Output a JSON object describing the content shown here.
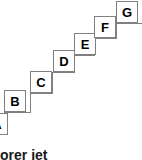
{
  "figure": {
    "type": "staircase-diagram",
    "colors": {
      "background": "#ffffff",
      "node_fill": "#ffffff",
      "node_border": "#808080",
      "step_line": "#808080",
      "label_text": "#000000",
      "caption_text": "#1a1a1a"
    },
    "nodes": [
      {
        "label": "A",
        "x": -14,
        "y": 113,
        "size": 22,
        "clipped": true
      },
      {
        "label": "B",
        "x": 4,
        "y": 90,
        "size": 22,
        "clipped": false
      },
      {
        "label": "C",
        "x": 30,
        "y": 71,
        "size": 22,
        "clipped": false
      },
      {
        "label": "D",
        "x": 53,
        "y": 50,
        "size": 22,
        "clipped": false
      },
      {
        "label": "E",
        "x": 74,
        "y": 33,
        "size": 22,
        "clipped": false
      },
      {
        "label": "F",
        "x": 94,
        "y": 16,
        "size": 22,
        "clipped": false
      },
      {
        "label": "G",
        "x": 116,
        "y": 1,
        "size": 22,
        "clipped": false
      }
    ],
    "step_path": "M0,131 L4,131 L4,112 L30,112 L30,93 L52,93 L52,72 L74,72 L74,55 L94,55 L94,38 L116,38 L116,23 L142,23"
  },
  "caption": {
    "text": "explorer jet",
    "truncated": true
  }
}
